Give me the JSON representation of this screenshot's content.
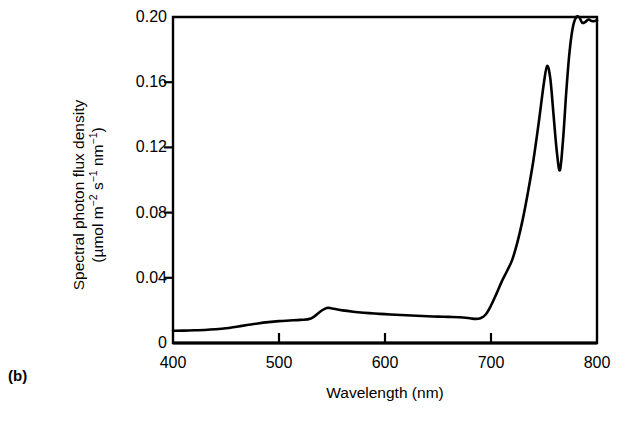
{
  "figure": {
    "panel_label": "(b)"
  },
  "chart_data": {
    "type": "line",
    "title": "",
    "subtitle": "",
    "xlabel": "Wavelength (nm)",
    "ylabel_line1": "Spectral photon flux density",
    "ylabel_line2_prefix": "(µmol m",
    "ylabel_line2_sup1": "−2",
    "ylabel_line2_mid1": " s",
    "ylabel_line2_sup2": "−1",
    "ylabel_line2_mid2": " nm",
    "ylabel_line2_sup3": "−1",
    "ylabel_line2_suffix": ")",
    "ylabel_plain": "Spectral photon flux density (µmol m⁻² s⁻¹ nm⁻¹)",
    "xlim": [
      400,
      800
    ],
    "ylim": [
      0,
      0.2
    ],
    "xticks": [
      400,
      500,
      600,
      700,
      800
    ],
    "xticklabels": [
      "400",
      "500",
      "600",
      "700",
      "800"
    ],
    "yticks": [
      0,
      0.04,
      0.08,
      0.12,
      0.16,
      0.2
    ],
    "yticklabels": [
      "0",
      "0.04",
      "0.08",
      "0.12",
      "0.16",
      "0.20"
    ],
    "grid": false,
    "legend": "none",
    "line_color": "#000000",
    "line_width_px": 2.6,
    "series": [
      {
        "name": "Spectral photon flux density",
        "x": [
          400,
          410,
          420,
          430,
          440,
          450,
          460,
          470,
          480,
          490,
          500,
          510,
          520,
          530,
          540,
          545,
          550,
          560,
          570,
          580,
          590,
          600,
          610,
          620,
          630,
          640,
          650,
          660,
          670,
          680,
          685,
          690,
          695,
          700,
          705,
          710,
          715,
          720,
          725,
          730,
          735,
          740,
          745,
          750,
          753,
          756,
          759,
          762,
          765,
          768,
          771,
          774,
          777,
          780,
          783,
          786,
          789,
          792,
          795,
          798,
          800
        ],
        "y": [
          0.0075,
          0.0076,
          0.0078,
          0.008,
          0.0084,
          0.009,
          0.01,
          0.011,
          0.012,
          0.0128,
          0.0134,
          0.0138,
          0.0142,
          0.015,
          0.0198,
          0.0215,
          0.0212,
          0.02,
          0.0192,
          0.0186,
          0.0181,
          0.0177,
          0.0173,
          0.017,
          0.0167,
          0.0164,
          0.0162,
          0.016,
          0.0158,
          0.0152,
          0.0148,
          0.0152,
          0.0175,
          0.023,
          0.03,
          0.0375,
          0.044,
          0.051,
          0.062,
          0.076,
          0.093,
          0.112,
          0.135,
          0.16,
          0.17,
          0.162,
          0.14,
          0.118,
          0.106,
          0.125,
          0.154,
          0.178,
          0.193,
          0.1995,
          0.2,
          0.1965,
          0.197,
          0.1985,
          0.1975,
          0.1975,
          0.198
        ]
      }
    ],
    "annotations": [
      {
        "label": "green hump",
        "x": 545,
        "y": 0.0215
      },
      {
        "label": "red edge rise start",
        "x": 690,
        "y": 0.0152
      },
      {
        "label": "far-red peak",
        "x": 753,
        "y": 0.17
      },
      {
        "label": "O2-A absorption dip",
        "x": 765,
        "y": 0.106
      },
      {
        "label": "near-IR plateau",
        "x": 783,
        "y": 0.2
      }
    ]
  }
}
